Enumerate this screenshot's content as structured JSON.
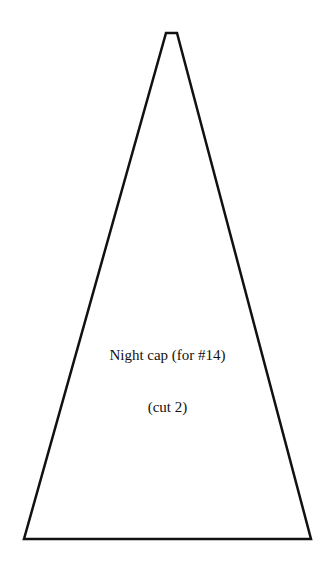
{
  "pattern": {
    "title": "Night cap (for #14)",
    "instruction": "(cut 2)",
    "shape": "trapezoid",
    "stroke_color": "#111111",
    "background": "#ffffff"
  }
}
